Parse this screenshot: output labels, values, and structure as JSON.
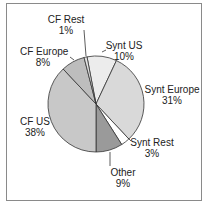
{
  "chart_data": {
    "type": "pie",
    "title": "",
    "categories": [
      "Synt US",
      "Synt Europe",
      "Synt Rest",
      "Other",
      "CF US",
      "CF Europe",
      "CF Rest"
    ],
    "values": [
      10,
      31,
      3,
      9,
      38,
      8,
      1
    ],
    "colors": [
      "#ececec",
      "#d9d9d9",
      "#ffffff",
      "#9a9a9a",
      "#c8c8c8",
      "#bdbdbd",
      "#e4e4e4"
    ],
    "start_angle_deg": -10.8,
    "direction": "clockwise",
    "labels": [
      {
        "name": "Synt US",
        "pct": "10%"
      },
      {
        "name": "Synt Europe",
        "pct": "31%"
      },
      {
        "name": "Synt Rest",
        "pct": "3%"
      },
      {
        "name": "Other",
        "pct": "9%"
      },
      {
        "name": "CF US",
        "pct": "38%"
      },
      {
        "name": "CF Europe",
        "pct": "8%"
      },
      {
        "name": "CF Rest",
        "pct": "1%"
      }
    ]
  }
}
